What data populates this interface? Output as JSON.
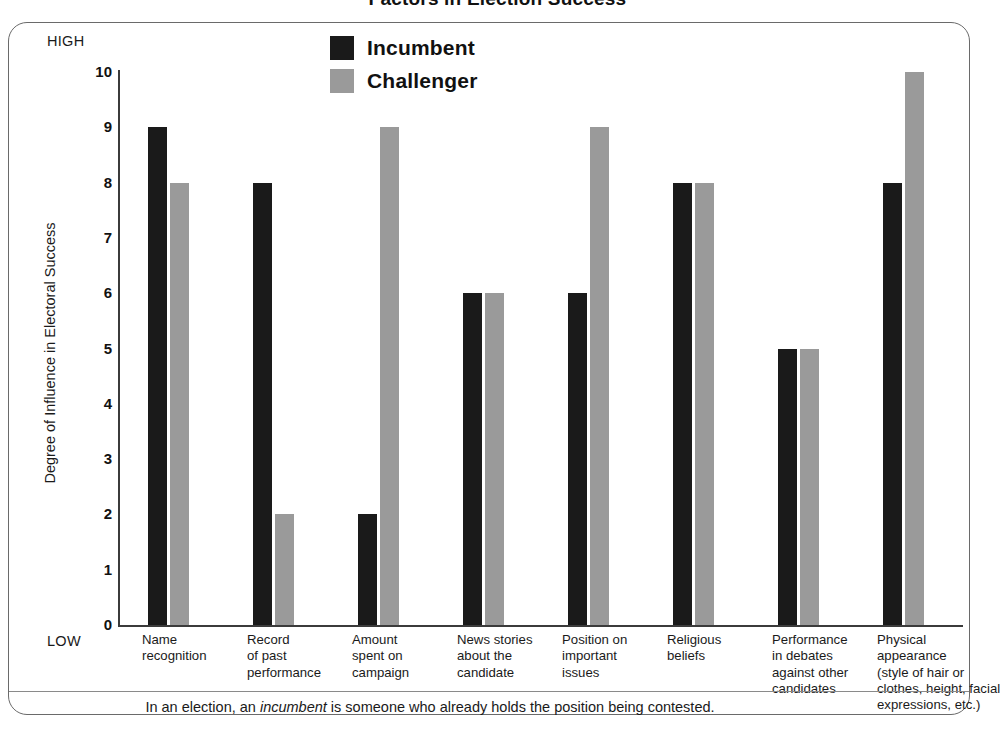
{
  "chart_data": {
    "type": "bar",
    "title": "Factors in Election Success",
    "xlabel": "",
    "ylabel": "Degree of Influence in Electoral Success",
    "ylim": [
      0,
      10
    ],
    "yticks": [
      "0",
      "1",
      "2",
      "3",
      "4",
      "5",
      "6",
      "7",
      "8",
      "9",
      "10"
    ],
    "y_axis_high_label": "HIGH",
    "y_axis_low_label": "LOW",
    "grid": false,
    "legend_position": "top-center",
    "categories": [
      "Name recognition",
      "Record of past performance",
      "Amount spent on campaign",
      "News stories about the candidate",
      "Position on important issues",
      "Religious beliefs",
      "Performance in debates against other candidates",
      "Physical appearance (style of hair or clothes, height, facial expressions, etc.)"
    ],
    "category_lines": [
      [
        "Name",
        "recognition"
      ],
      [
        "Record",
        "of past",
        "performance"
      ],
      [
        "Amount",
        "spent on",
        "campaign"
      ],
      [
        "News stories",
        "about the",
        "candidate"
      ],
      [
        "Position on",
        "important",
        "issues"
      ],
      [
        "Religious",
        "beliefs"
      ],
      [
        "Performance",
        "in debates",
        "against other",
        "candidates"
      ],
      [
        "Physical",
        "appearance",
        "(style of hair or",
        "clothes, height, facial",
        "expressions, etc.)"
      ]
    ],
    "series": [
      {
        "name": "Incumbent",
        "color": "#1a1a1a",
        "values": [
          9,
          8,
          2,
          6,
          6,
          8,
          5,
          8
        ]
      },
      {
        "name": "Challenger",
        "color": "#9a9a9a",
        "values": [
          8,
          2,
          9,
          6,
          9,
          8,
          5,
          10
        ]
      }
    ]
  },
  "legend": {
    "items": [
      {
        "label": "Incumbent",
        "color": "#1a1a1a"
      },
      {
        "label": "Challenger",
        "color": "#9a9a9a"
      }
    ]
  },
  "footnote": {
    "prefix": "In an election, an ",
    "emphasis": "incumbent",
    "suffix": " is someone who already holds the position being contested."
  },
  "colors": {
    "incumbent": "#1a1a1a",
    "challenger": "#9a9a9a",
    "frame": "#6a6a6a",
    "axis": "#3b3b3b",
    "text": "#1a1a1a"
  }
}
